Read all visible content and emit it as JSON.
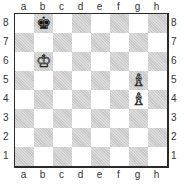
{
  "board": {
    "files": [
      "a",
      "b",
      "c",
      "d",
      "e",
      "f",
      "g",
      "h"
    ],
    "ranks": [
      "8",
      "7",
      "6",
      "5",
      "4",
      "3",
      "2",
      "1"
    ],
    "light_color": "#ffffff",
    "dark_color": "#c9c9c9",
    "pieces": [
      {
        "square": "b8",
        "color": "black",
        "type": "king",
        "glyph": "♚"
      },
      {
        "square": "b6",
        "color": "white",
        "type": "king",
        "glyph": "♔"
      },
      {
        "square": "g5",
        "color": "white",
        "type": "bishop",
        "glyph": "♗"
      },
      {
        "square": "g4",
        "color": "white",
        "type": "bishop",
        "glyph": "♗"
      }
    ]
  }
}
